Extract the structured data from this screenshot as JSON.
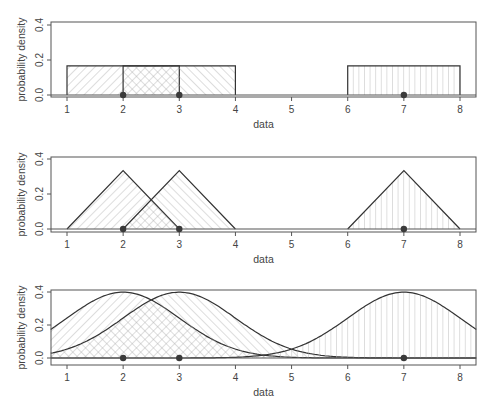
{
  "figure": {
    "panels": [
      {
        "id": "uniform",
        "xlabel": "data",
        "ylabel": "probability density"
      },
      {
        "id": "triangular",
        "xlabel": "data",
        "ylabel": "probability density"
      },
      {
        "id": "gaussian",
        "xlabel": "data",
        "ylabel": "probability density"
      }
    ]
  },
  "chart_data": [
    {
      "type": "area",
      "title": "",
      "kernel": "rectangular",
      "xlabel": "data",
      "ylabel": "probability density",
      "xlim": [
        0.71,
        8.29
      ],
      "ylim": [
        0,
        0.4
      ],
      "xticks": [
        1,
        2,
        3,
        4,
        5,
        6,
        7,
        8
      ],
      "yticks": [
        0.0,
        0.2,
        0.4
      ],
      "ytick_labels": [
        "0.0",
        "0.2",
        "0.4"
      ],
      "data_points": [
        2,
        3,
        7
      ],
      "series": [
        {
          "name": "kernel at 2",
          "center": 2,
          "support": [
            1,
            3
          ],
          "height": 0.167,
          "hatch": "diagonal-up"
        },
        {
          "name": "kernel at 3",
          "center": 3,
          "support": [
            2,
            4
          ],
          "height": 0.167,
          "hatch": "diagonal-down"
        },
        {
          "name": "kernel at 7",
          "center": 7,
          "support": [
            6,
            8
          ],
          "height": 0.167,
          "hatch": "vertical"
        }
      ]
    },
    {
      "type": "area",
      "title": "",
      "kernel": "triangular",
      "xlabel": "data",
      "ylabel": "probability density",
      "xlim": [
        0.71,
        8.29
      ],
      "ylim": [
        0,
        0.4
      ],
      "xticks": [
        1,
        2,
        3,
        4,
        5,
        6,
        7,
        8
      ],
      "yticks": [
        0.0,
        0.2,
        0.4
      ],
      "ytick_labels": [
        "0.0",
        "0.2",
        "0.4"
      ],
      "data_points": [
        2,
        3,
        7
      ],
      "series": [
        {
          "name": "kernel at 2",
          "center": 2,
          "support": [
            1,
            3
          ],
          "peak": 0.333,
          "hatch": "diagonal-up"
        },
        {
          "name": "kernel at 3",
          "center": 3,
          "support": [
            2,
            4
          ],
          "peak": 0.333,
          "hatch": "diagonal-down"
        },
        {
          "name": "kernel at 7",
          "center": 7,
          "support": [
            6,
            8
          ],
          "peak": 0.333,
          "hatch": "vertical"
        }
      ]
    },
    {
      "type": "area",
      "title": "",
      "kernel": "gaussian",
      "xlabel": "data",
      "ylabel": "probability density",
      "xlim": [
        0.71,
        8.29
      ],
      "ylim": [
        0,
        0.4
      ],
      "xticks": [
        1,
        2,
        3,
        4,
        5,
        6,
        7,
        8
      ],
      "yticks": [
        0.0,
        0.2,
        0.4
      ],
      "ytick_labels": [
        "0.0",
        "0.2",
        "0.4"
      ],
      "data_points": [
        2,
        3,
        7
      ],
      "series": [
        {
          "name": "kernel at 2",
          "mean": 2,
          "sd": 1,
          "peak": 0.399,
          "hatch": "diagonal-up"
        },
        {
          "name": "kernel at 3",
          "mean": 3,
          "sd": 1,
          "peak": 0.399,
          "hatch": "diagonal-down"
        },
        {
          "name": "kernel at 7",
          "mean": 7,
          "sd": 1,
          "peak": 0.399,
          "hatch": "vertical"
        }
      ]
    }
  ],
  "style": {
    "line_color": "#333333",
    "hatch_color": "#aaaaaa",
    "axis_color": "#555555",
    "point_color": "#3a3a3a"
  }
}
